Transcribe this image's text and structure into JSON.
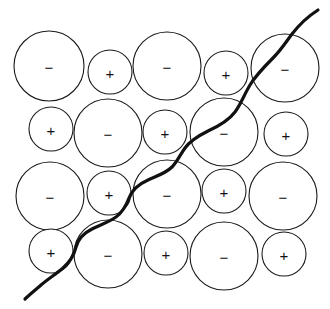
{
  "figure": {
    "width": 330,
    "height": 309,
    "background_color": "#ffffff",
    "circle_stroke_color": "#1a1a1a",
    "circle_fill_color": "#ffffff",
    "curve_color": "#111111",
    "label_color": "#111111"
  },
  "lattice": {
    "rows": 4,
    "columns": 5,
    "anion_label": "−",
    "cation_label": "+",
    "ions": [
      {
        "id": "ion-r1c1",
        "row": 1,
        "col": 1,
        "sign": "−",
        "cx": 49,
        "cy": 66,
        "r": 35
      },
      {
        "id": "ion-r1c2",
        "row": 1,
        "col": 2,
        "sign": "+",
        "cx": 110,
        "cy": 72,
        "r": 22
      },
      {
        "id": "ion-r1c3",
        "row": 1,
        "col": 3,
        "sign": "−",
        "cx": 167,
        "cy": 66,
        "r": 34
      },
      {
        "id": "ion-r1c4",
        "row": 1,
        "col": 4,
        "sign": "+",
        "cx": 226,
        "cy": 73,
        "r": 22
      },
      {
        "id": "ion-r1c5",
        "row": 1,
        "col": 5,
        "sign": "−",
        "cx": 285,
        "cy": 68,
        "r": 34
      },
      {
        "id": "ion-r2c1",
        "row": 2,
        "col": 1,
        "sign": "+",
        "cx": 51,
        "cy": 129,
        "r": 22
      },
      {
        "id": "ion-r2c2",
        "row": 2,
        "col": 2,
        "sign": "−",
        "cx": 108,
        "cy": 133,
        "r": 34
      },
      {
        "id": "ion-r2c3",
        "row": 2,
        "col": 3,
        "sign": "+",
        "cx": 165,
        "cy": 132,
        "r": 22
      },
      {
        "id": "ion-r2c4",
        "row": 2,
        "col": 4,
        "sign": "−",
        "cx": 224,
        "cy": 132,
        "r": 34
      },
      {
        "id": "ion-r2c5",
        "row": 2,
        "col": 5,
        "sign": "+",
        "cx": 286,
        "cy": 134,
        "r": 22
      },
      {
        "id": "ion-r3c1",
        "row": 3,
        "col": 1,
        "sign": "−",
        "cx": 50,
        "cy": 196,
        "r": 34
      },
      {
        "id": "ion-r3c2",
        "row": 3,
        "col": 2,
        "sign": "+",
        "cx": 109,
        "cy": 193,
        "r": 22
      },
      {
        "id": "ion-r3c3",
        "row": 3,
        "col": 3,
        "sign": "−",
        "cx": 167,
        "cy": 194,
        "r": 34
      },
      {
        "id": "ion-r3c4",
        "row": 3,
        "col": 4,
        "sign": "+",
        "cx": 224,
        "cy": 191,
        "r": 22
      },
      {
        "id": "ion-r3c5",
        "row": 3,
        "col": 5,
        "sign": "−",
        "cx": 283,
        "cy": 196,
        "r": 34
      },
      {
        "id": "ion-r4c1",
        "row": 4,
        "col": 1,
        "sign": "+",
        "cx": 51,
        "cy": 251,
        "r": 22
      },
      {
        "id": "ion-r4c2",
        "row": 4,
        "col": 2,
        "sign": "−",
        "cx": 108,
        "cy": 254,
        "r": 34
      },
      {
        "id": "ion-r4c3",
        "row": 4,
        "col": 3,
        "sign": "+",
        "cx": 166,
        "cy": 253,
        "r": 22
      },
      {
        "id": "ion-r4c4",
        "row": 4,
        "col": 4,
        "sign": "−",
        "cx": 224,
        "cy": 256,
        "r": 34
      },
      {
        "id": "ion-r4c5",
        "row": 4,
        "col": 5,
        "sign": "+",
        "cx": 284,
        "cy": 254,
        "r": 22
      }
    ]
  },
  "boundary": {
    "name": "cleavage-line",
    "path": "M 318 10 C 307 17 299 25 292 34 C 286 42 281 50 273 58 C 265 66 256 75 250 85 C 244 95 241 104 235 112 C 229 120 219 126 208 131 C 198 136 190 141 185 148 C 180 155 177 162 172 167 C 166 173 157 176 148 180 C 139 184 132 190 129 198 C 126 206 123 212 116 217 C 109 222 100 225 92 229 C 84 233 78 239 76 247 C 74 255 70 262 63 268 C 56 274 48 279 41 285 C 34 291 29 295 25 299"
  }
}
